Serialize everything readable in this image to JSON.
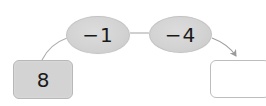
{
  "diagram": {
    "type": "arrow-operation-chain",
    "start": {
      "value": "8"
    },
    "operations": [
      {
        "label": "−1"
      },
      {
        "label": "−4"
      }
    ],
    "result": {
      "value": ""
    }
  },
  "colors": {
    "oval_fill": "#d4d4d4",
    "box_fill": "#d3d3d3",
    "answer_box_fill": "#ffffff",
    "border": "#bdbdbd",
    "line": "#a8a8a8",
    "text": "#1a1a1a"
  }
}
